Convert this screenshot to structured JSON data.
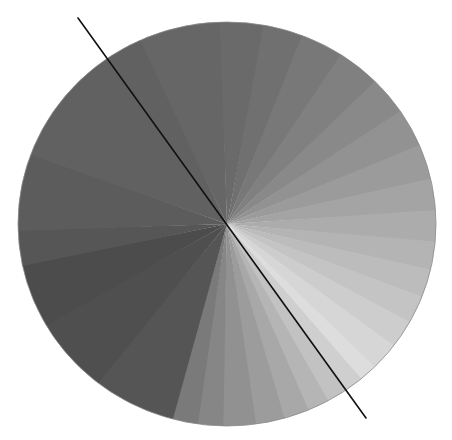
{
  "figure": {
    "background": "#ffffff",
    "disc": {
      "cx": 227,
      "cy": 224,
      "rx": 209,
      "ry": 202,
      "edge_color": "#8a8a8a"
    },
    "wedges": [
      {
        "start": -115,
        "end": -92,
        "color": "#666666"
      },
      {
        "start": -92,
        "end": -80,
        "color": "#6a6a6a"
      },
      {
        "start": -80,
        "end": -69,
        "color": "#707070"
      },
      {
        "start": -69,
        "end": -57,
        "color": "#787878"
      },
      {
        "start": -57,
        "end": -45,
        "color": "#808080"
      },
      {
        "start": -45,
        "end": -34,
        "color": "#898989"
      },
      {
        "start": -34,
        "end": -23,
        "color": "#929292"
      },
      {
        "start": -23,
        "end": -13,
        "color": "#9b9b9b"
      },
      {
        "start": -13,
        "end": -4,
        "color": "#a4a4a4"
      },
      {
        "start": -4,
        "end": 5,
        "color": "#acacac"
      },
      {
        "start": 5,
        "end": 13,
        "color": "#b4b4b4"
      },
      {
        "start": 13,
        "end": 21,
        "color": "#bcbcbc"
      },
      {
        "start": 21,
        "end": 29,
        "color": "#c4c4c4"
      },
      {
        "start": 29,
        "end": 37,
        "color": "#cdcdcd"
      },
      {
        "start": 37,
        "end": 45,
        "color": "#d6d6d6"
      },
      {
        "start": 45,
        "end": 50,
        "color": "#dddddd"
      },
      {
        "start": 50,
        "end": 55,
        "color": "#cfcfcf"
      },
      {
        "start": 55,
        "end": 61,
        "color": "#c2c2c2"
      },
      {
        "start": 61,
        "end": 67,
        "color": "#b5b5b5"
      },
      {
        "start": 67,
        "end": 74,
        "color": "#a8a8a8"
      },
      {
        "start": 74,
        "end": 82,
        "color": "#9c9c9c"
      },
      {
        "start": 82,
        "end": 91,
        "color": "#919191"
      },
      {
        "start": 91,
        "end": 98,
        "color": "#868686"
      },
      {
        "start": 98,
        "end": 105,
        "color": "#7a7a7a"
      },
      {
        "start": 105,
        "end": 128,
        "color": "#555555"
      },
      {
        "start": 128,
        "end": 150,
        "color": "#4f4f4f"
      },
      {
        "start": 150,
        "end": 168,
        "color": "#4c4c4c"
      },
      {
        "start": 168,
        "end": 178,
        "color": "#565656"
      },
      {
        "start": 178,
        "end": 200,
        "color": "#5c5c5c"
      },
      {
        "start": 200,
        "end": 245,
        "color": "#616161"
      }
    ],
    "line": {
      "x1": 78,
      "y1": 18,
      "x2": 366,
      "y2": 418,
      "color": "#111111",
      "width": 1.6
    }
  }
}
